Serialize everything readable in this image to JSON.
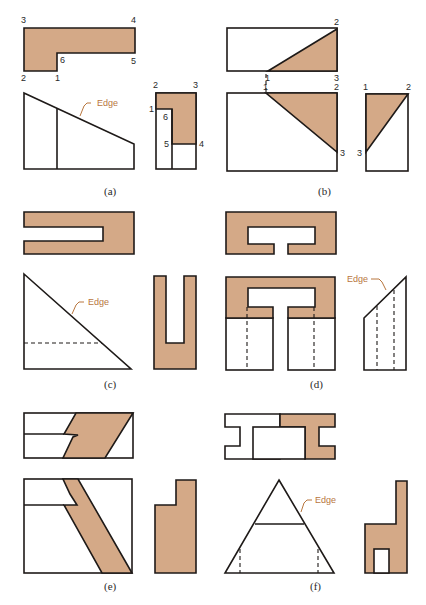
{
  "figure": {
    "fill_color": "#d4a987",
    "line_color": "#1e1a18",
    "edge_color": "#b8763e",
    "panels": [
      {
        "id": "a",
        "caption": "(a)",
        "top_view_labels": [
          "3",
          "4",
          "6",
          "5",
          "2",
          "1"
        ],
        "side_view_labels": [
          "2",
          "3",
          "1",
          "6",
          "5",
          "4"
        ],
        "edge_label": "Edge"
      },
      {
        "id": "b",
        "caption": "(b)",
        "top_view_labels": [
          "2",
          "1",
          "3"
        ],
        "front_view_labels": [
          "1",
          "2",
          "3"
        ],
        "side_view_labels": [
          "1",
          "2",
          "3"
        ]
      },
      {
        "id": "c",
        "caption": "(c)",
        "edge_label": "Edge"
      },
      {
        "id": "d",
        "caption": "(d)",
        "edge_label": "Edge"
      },
      {
        "id": "e",
        "caption": "(e)"
      },
      {
        "id": "f",
        "caption": "(f)",
        "edge_label": "Edge"
      }
    ]
  }
}
